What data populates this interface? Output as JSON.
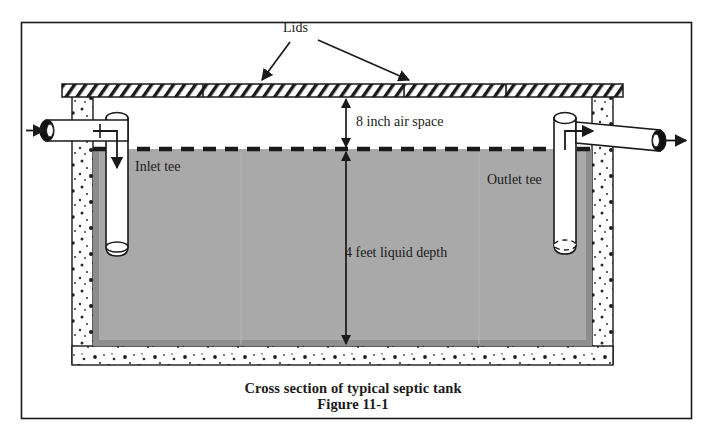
{
  "figure": {
    "domain": "Diagram",
    "caption_title": "Cross section of typical septic tank",
    "caption_figure": "Figure 11-1",
    "labels": {
      "lids": "Lids",
      "air_space": "8 inch air space",
      "liquid_depth": "4 feet liquid depth",
      "inlet_tee": "Inlet tee",
      "outlet_tee": "Outlet tee"
    },
    "dimensions": [
      {
        "name": "air-space",
        "value": "8",
        "unit": "inch",
        "text": "8 inch air space"
      },
      {
        "name": "liquid-depth",
        "value": "4",
        "unit": "feet",
        "text": "4 feet liquid depth"
      }
    ],
    "colors": {
      "liquid_fill": "#a9a9a9",
      "liquid_edge": "#6f6f6f",
      "concrete_fill": "#ffffff",
      "outline": "#1a1a1a",
      "lid_hatch": "#1a1a1a",
      "page_background": "#ffffff",
      "pipe_fill": "#ffffff",
      "pipe_end": "#111111"
    },
    "parts": [
      "outer-frame",
      "lid-slab",
      "tank-wall-left",
      "tank-wall-right",
      "tank-floor",
      "liquid-body",
      "water-line",
      "inlet-pipe",
      "inlet-tee-riser",
      "outlet-tee-riser",
      "outlet-pipe",
      "flow-arrows",
      "dimension-arrows",
      "leader-arrows"
    ]
  }
}
